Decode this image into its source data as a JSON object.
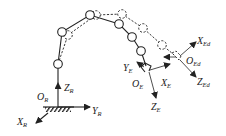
{
  "diagram": {
    "type": "robot-arm-kinematics",
    "base_frame": {
      "origin": {
        "main": "O",
        "sub": "R"
      },
      "x_axis": {
        "main": "X",
        "sub": "R"
      },
      "y_axis": {
        "main": "Y",
        "sub": "R"
      },
      "z_axis": {
        "main": "Z",
        "sub": "R"
      }
    },
    "end_effector_frame": {
      "origin": {
        "main": "O",
        "sub": "E"
      },
      "x_axis": {
        "main": "X",
        "sub": "E"
      },
      "y_axis": {
        "main": "Y",
        "sub": "E"
      },
      "z_axis": {
        "main": "Z",
        "sub": "E"
      }
    },
    "desired_end_effector_frame": {
      "origin": {
        "main": "O",
        "sub": "Ed"
      },
      "x_axis": {
        "main": "X",
        "sub": "Ed"
      },
      "z_axis": {
        "main": "Z",
        "sub": "Ed"
      }
    },
    "current_arm_style": "solid",
    "desired_arm_style": "dashed",
    "stroke_color": "#222222"
  }
}
